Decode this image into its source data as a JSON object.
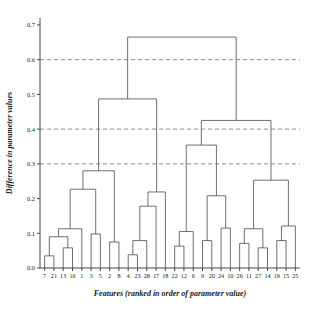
{
  "chart_data": {
    "type": "dendrogram",
    "title": "",
    "xlabel": "Features (ranked in order of parameter value)",
    "ylabel": "Difference in parameter values",
    "ylim": [
      0.0,
      0.72
    ],
    "yticks": [
      0.0,
      0.1,
      0.2,
      0.3,
      0.4,
      0.5,
      0.6,
      0.7
    ],
    "ytick_labels": [
      "0.0",
      "0.1",
      "0.2",
      "0.3",
      "0.4",
      "0.5",
      "0.6",
      "0.7"
    ],
    "grid": false,
    "reference_lines": [
      {
        "y": 0.3,
        "style": "dashed",
        "color": "#808080"
      },
      {
        "y": 0.4,
        "style": "dashed",
        "color": "#808080"
      },
      {
        "y": 0.6,
        "style": "dashed",
        "color": "#808080"
      }
    ],
    "leaf_labels": [
      "7",
      "21",
      "13",
      "16",
      "1",
      "3",
      "5",
      "2",
      "8",
      "4",
      "23",
      "28",
      "17",
      "18",
      "22",
      "12",
      "6",
      "9",
      "20",
      "24",
      "10",
      "26",
      "11",
      "27",
      "14",
      "19",
      "15",
      "25"
    ],
    "n_leaves": 28,
    "line_color": "#555555",
    "merges": [
      {
        "id": "m1",
        "left": "7",
        "right": "21",
        "height": 0.035
      },
      {
        "id": "m2",
        "left": "13",
        "right": "16",
        "height": 0.058
      },
      {
        "id": "m3",
        "left": "m1",
        "right": "m2",
        "height": 0.09
      },
      {
        "id": "m4",
        "left": "3",
        "right": "5",
        "height": 0.098
      },
      {
        "id": "m5",
        "left": "m3",
        "right": "1",
        "height": 0.113
      },
      {
        "id": "m6",
        "left": "2",
        "right": "8",
        "height": 0.075
      },
      {
        "id": "m7",
        "left": "m5",
        "right": "m4",
        "height": 0.227
      },
      {
        "id": "m8",
        "left": "4",
        "right": "23",
        "height": 0.038
      },
      {
        "id": "m9",
        "left": "m8",
        "right": "28",
        "height": 0.079
      },
      {
        "id": "m10",
        "left": "m9",
        "right": "17",
        "height": 0.178
      },
      {
        "id": "m11",
        "left": "m10",
        "right": "18",
        "height": 0.219
      },
      {
        "id": "m12",
        "left": "m7",
        "right": "m6",
        "height": 0.28
      },
      {
        "id": "m13",
        "left": "m12",
        "right": "m11",
        "height": 0.487
      },
      {
        "id": "m14",
        "left": "22",
        "right": "12",
        "height": 0.063
      },
      {
        "id": "m15",
        "left": "m14",
        "right": "6",
        "height": 0.105
      },
      {
        "id": "m16",
        "left": "9",
        "right": "20",
        "height": 0.079
      },
      {
        "id": "m17",
        "left": "24",
        "right": "10",
        "height": 0.115
      },
      {
        "id": "m18",
        "left": "m16",
        "right": "m17",
        "height": 0.208
      },
      {
        "id": "m19",
        "left": "m15",
        "right": "m18",
        "height": 0.354
      },
      {
        "id": "m20",
        "left": "26",
        "right": "11",
        "height": 0.071
      },
      {
        "id": "m21",
        "left": "27",
        "right": "14",
        "height": 0.058
      },
      {
        "id": "m22",
        "left": "m20",
        "right": "m21",
        "height": 0.113
      },
      {
        "id": "m23",
        "left": "19",
        "right": "15",
        "height": 0.079
      },
      {
        "id": "m24",
        "left": "m23",
        "right": "25",
        "height": 0.121
      },
      {
        "id": "m25",
        "left": "m22",
        "right": "m24",
        "height": 0.253
      },
      {
        "id": "m26",
        "left": "m19",
        "right": "m25",
        "height": 0.425
      },
      {
        "id": "m27",
        "left": "m13",
        "right": "m26",
        "height": 0.665
      }
    ]
  },
  "axes": {
    "y_title": "Difference in parameter values",
    "x_title": "Features (ranked in order of parameter value)"
  }
}
